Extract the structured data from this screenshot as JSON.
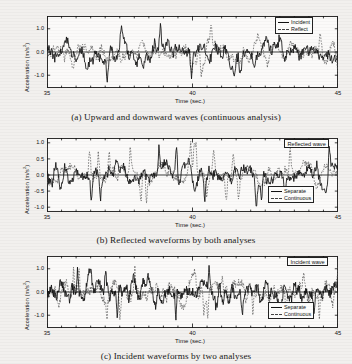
{
  "figure": {
    "background_color": "#f2f0ee",
    "ink_color": "#111111"
  },
  "panels": [
    {
      "id": "panel-a",
      "caption": "(a) Upward and downward waves (continuous analysis)",
      "tag": null,
      "legend": [
        {
          "label": "Incident",
          "style": "solid"
        },
        {
          "label": "Reflect",
          "style": "dashed"
        }
      ],
      "legend_position": "top-right",
      "chart_data": {
        "type": "line",
        "title": "",
        "xlabel": "Time (sec.)",
        "ylabel": "Acceleration (m/s²)",
        "xlim": [
          35,
          45
        ],
        "ylim": [
          -1.55,
          1.55
        ],
        "xticks": [
          35,
          40,
          45
        ],
        "xticklabels": [
          "35",
          "40",
          "45"
        ],
        "yticks": [
          -1.0,
          0.0,
          1.0
        ],
        "yticklabels": [
          "-1.0",
          "0.0",
          "1.0"
        ],
        "grid": false,
        "series": [
          {
            "name": "Incident",
            "style": "solid",
            "color": "#111111",
            "amplitude": 0.62,
            "peak": 1.35,
            "density": 150,
            "seed": 11
          },
          {
            "name": "Reflect",
            "style": "dashed",
            "color": "#555555",
            "amplitude": 0.52,
            "peak": 1.2,
            "density": 150,
            "seed": 29
          }
        ]
      }
    },
    {
      "id": "panel-b",
      "caption": "(b) Reflected waveforms by both analyses",
      "tag": "Reflected wave",
      "legend": [
        {
          "label": "Separate",
          "style": "solid"
        },
        {
          "label": "Continuous",
          "style": "dashed"
        }
      ],
      "legend_position": "bottom-right",
      "chart_data": {
        "type": "line",
        "title": "",
        "xlabel": "Time (sec.)",
        "ylabel": "Acceleration (m/s²)",
        "xlim": [
          35,
          45
        ],
        "ylim": [
          -1.15,
          1.15
        ],
        "xticks": [
          35,
          40,
          45
        ],
        "xticklabels": [
          "35",
          "40",
          "45"
        ],
        "yticks": [
          -1.0,
          -0.5,
          0.0,
          0.5,
          1.0
        ],
        "yticklabels": [
          "-1.0",
          "-0.5",
          "0.0",
          "0.5",
          "1.0"
        ],
        "grid": false,
        "series": [
          {
            "name": "Separate",
            "style": "solid",
            "color": "#111111",
            "amplitude": 0.4,
            "peak": 1.0,
            "density": 165,
            "seed": 47
          },
          {
            "name": "Continuous",
            "style": "dashed",
            "color": "#555555",
            "amplitude": 0.36,
            "peak": 0.95,
            "density": 165,
            "seed": 63
          }
        ]
      }
    },
    {
      "id": "panel-c",
      "caption": "(c) Incident waveforms by two analyses",
      "tag": "Incident wave",
      "legend": [
        {
          "label": "Separate",
          "style": "solid"
        },
        {
          "label": "Continuous",
          "style": "dashed"
        }
      ],
      "legend_position": "bottom-right",
      "chart_data": {
        "type": "line",
        "title": "",
        "xlabel": "Time (sec.)",
        "ylabel": "Acceleration (m/s²)",
        "xlim": [
          35,
          45
        ],
        "ylim": [
          -1.55,
          1.55
        ],
        "xticks": [
          35,
          40,
          45
        ],
        "xticklabels": [
          "35",
          "40",
          "45"
        ],
        "yticks": [
          -1.0,
          0.0,
          1.0
        ],
        "yticklabels": [
          "-1.0",
          "0.0",
          "1.0"
        ],
        "grid": false,
        "series": [
          {
            "name": "Separate",
            "style": "solid",
            "color": "#111111",
            "amplitude": 0.58,
            "peak": 1.3,
            "density": 220,
            "seed": 83
          },
          {
            "name": "Continuous",
            "style": "dashed",
            "color": "#555555",
            "amplitude": 0.54,
            "peak": 1.25,
            "density": 220,
            "seed": 97
          }
        ]
      }
    }
  ]
}
